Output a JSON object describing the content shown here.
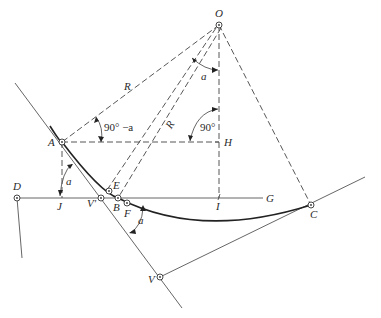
{
  "figure": {
    "points": {
      "O": {
        "label": "O"
      },
      "A": {
        "label": "A"
      },
      "H": {
        "label": "H"
      },
      "J": {
        "label": "J"
      },
      "D": {
        "label": "D"
      },
      "I": {
        "label": "I"
      },
      "G": {
        "label": "G"
      },
      "C": {
        "label": "C"
      },
      "V_prime": {
        "label": "V'"
      },
      "E": {
        "label": "E"
      },
      "B": {
        "label": "B"
      },
      "F": {
        "label": "F"
      },
      "V": {
        "label": "V"
      }
    },
    "dimensions": {
      "radius_OA": "R",
      "radius_OE": "R",
      "angle_at_A": "90° −a",
      "angle_at_H": "90°",
      "angle_at_O": "a",
      "angle_at_J": "a",
      "angle_at_F": "a"
    }
  }
}
